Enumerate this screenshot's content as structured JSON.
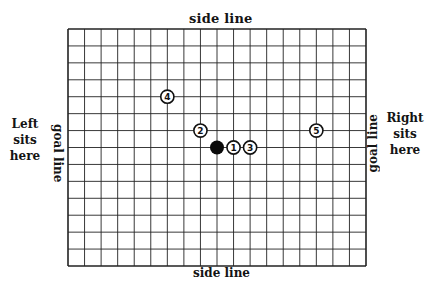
{
  "labels": {
    "top": "side line",
    "bottom": "side line",
    "left_goal": "goal line",
    "right_goal": "goal line",
    "left_seat": [
      "Left",
      "sits",
      "here"
    ],
    "right_seat": [
      "Right",
      "sits",
      "here"
    ]
  },
  "grid": {
    "columns": 18,
    "rows": 14,
    "line_color": "#222222"
  },
  "pieces": [
    {
      "id": "4",
      "label": "4",
      "col": 6,
      "row": 4,
      "type": "numbered"
    },
    {
      "id": "2",
      "label": "2",
      "col": 8,
      "row": 6,
      "type": "numbered"
    },
    {
      "id": "black",
      "label": "",
      "col": 9,
      "row": 7,
      "type": "solid"
    },
    {
      "id": "1",
      "label": "1",
      "col": 10,
      "row": 7,
      "type": "numbered"
    },
    {
      "id": "3",
      "label": "3",
      "col": 11,
      "row": 7,
      "type": "numbered"
    },
    {
      "id": "5",
      "label": "5",
      "col": 15,
      "row": 6,
      "type": "numbered"
    }
  ]
}
